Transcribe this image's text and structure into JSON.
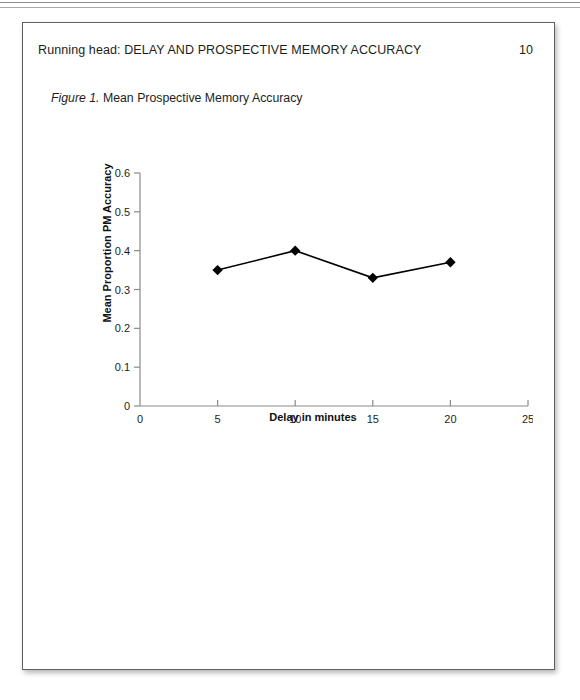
{
  "document": {
    "running_head": "Running head: DELAY AND PROSPECTIVE MEMORY ACCURACY",
    "page_number": "10",
    "figure_label": "Figure 1.",
    "figure_title": "Mean Prospective Memory Accuracy"
  },
  "chart_data": {
    "type": "line",
    "title": "Mean Prospective Memory Accuracy",
    "xlabel": "Delay in minutes",
    "ylabel": "Mean Proportion PM Accuracy",
    "x": [
      5,
      10,
      15,
      20
    ],
    "values": [
      0.35,
      0.4,
      0.33,
      0.37
    ],
    "series": [
      {
        "name": "Mean Proportion PM Accuracy",
        "values": [
          0.35,
          0.4,
          0.33,
          0.37
        ]
      }
    ],
    "xlim": [
      0,
      25
    ],
    "ylim": [
      0,
      0.6
    ],
    "xticks": [
      0,
      5,
      10,
      15,
      20,
      25
    ],
    "xtick_labels": [
      "0",
      "5",
      "10",
      "15",
      "20",
      "25"
    ],
    "yticks": [
      0,
      0.1,
      0.2,
      0.3,
      0.4,
      0.5,
      0.6
    ],
    "ytick_labels": [
      "0",
      "0.1",
      "0.2",
      "0.3",
      "0.4",
      "0.5",
      "0.6"
    ],
    "grid": false,
    "legend": false,
    "marker": "diamond",
    "line_color": "#000000",
    "marker_color": "#000000",
    "axis_color": "#808080"
  }
}
